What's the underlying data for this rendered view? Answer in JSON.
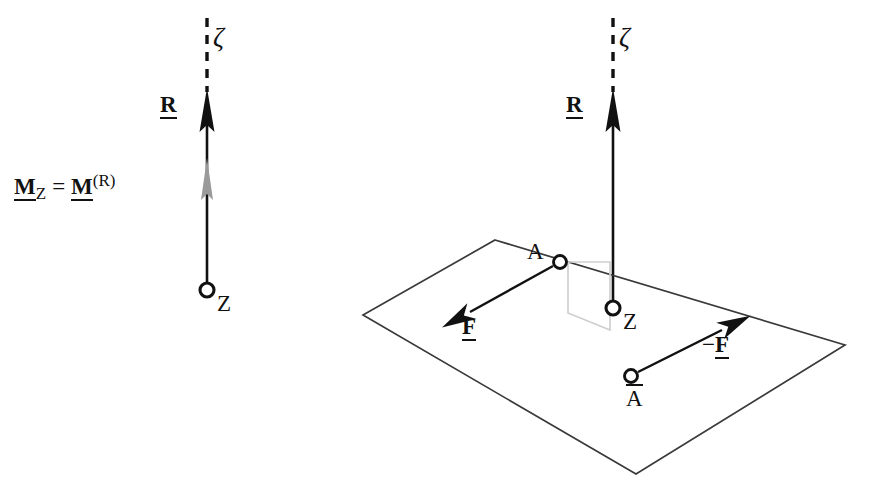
{
  "figure": {
    "background_color": "#ffffff",
    "stroke_color": "#111111",
    "gray_color": "#9a9a9a",
    "plane_color": "#3a3a3a",
    "width": 873,
    "height": 499
  },
  "left_panel": {
    "name": "resultant-and-moment-at-Z",
    "axis_label": "ζ",
    "resultant_label": "R",
    "moment_label_left": "M",
    "moment_sub": "Z",
    "moment_equals": "=",
    "moment_label_right": "M",
    "moment_sup": "(R)",
    "point_label": "Z"
  },
  "right_panel": {
    "name": "force-couple-in-plane",
    "axis_label": "ζ",
    "resultant_label": "R",
    "point_label": "Z",
    "point_a_label": "A",
    "point_abar_label": "A",
    "force_label": "F",
    "force_neg_sign": "−",
    "force_neg_label": "F"
  },
  "geometry": {
    "left_axis_x": 207,
    "right_axis_x": 613,
    "dash_top_y": 18,
    "arrow_tip_y": 88,
    "left_point_z_y": 290,
    "right_point_z_y": 308
  }
}
